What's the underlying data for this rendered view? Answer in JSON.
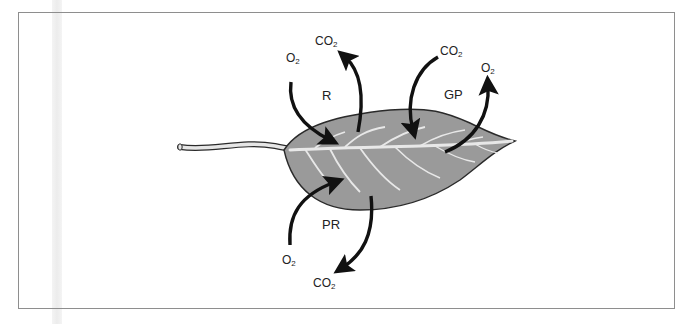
{
  "diagram": {
    "colors": {
      "leaf_fill": "#9a9a9a",
      "leaf_outline": "#2a2a2a",
      "veins": "#e8e8e8",
      "arrows": "#111111",
      "frame": "#8e8e8e"
    },
    "regions": {
      "r": "R",
      "gp": "GP",
      "pr": "PR"
    },
    "labels": {
      "r_in": {
        "base": "O",
        "sub": "2"
      },
      "r_out": {
        "base": "CO",
        "sub": "2"
      },
      "gp_in": {
        "base": "CO",
        "sub": "2"
      },
      "gp_out": {
        "base": "O",
        "sub": "2"
      },
      "pr_in": {
        "base": "O",
        "sub": "2"
      },
      "pr_out": {
        "base": "CO",
        "sub": "2"
      }
    }
  }
}
